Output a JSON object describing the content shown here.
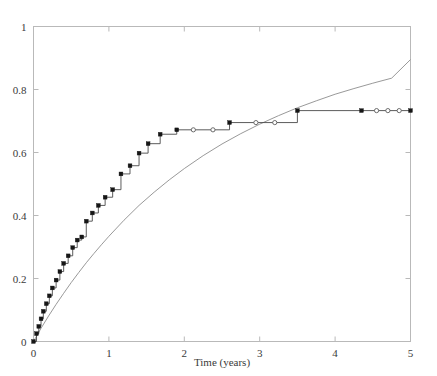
{
  "chart_data": {
    "type": "line",
    "title": "",
    "subtitle": "",
    "xlabel": "Time (years)",
    "ylabel": "",
    "xlim": [
      0,
      5
    ],
    "ylim": [
      0,
      1
    ],
    "grid": false,
    "legend": null,
    "xticks": [
      0,
      1,
      2,
      3,
      4,
      5
    ],
    "xticklabels": [
      "0",
      "1",
      "2",
      "3",
      "4",
      "5"
    ],
    "yticks": [
      0,
      0.2,
      0.4,
      0.6,
      0.8,
      1
    ],
    "yticklabels": [
      "0",
      "0.2",
      "0.4",
      "0.6",
      "0.8",
      "1"
    ],
    "series": [
      {
        "name": "step-estimate",
        "style": "step-post",
        "marker": "square-and-circle",
        "color": "#4a4a4a",
        "x": [
          0.0,
          0.04,
          0.07,
          0.1,
          0.13,
          0.17,
          0.21,
          0.25,
          0.3,
          0.35,
          0.4,
          0.46,
          0.52,
          0.58,
          0.64,
          0.7,
          0.78,
          0.86,
          0.95,
          1.05,
          1.16,
          1.28,
          1.4,
          1.52,
          1.68,
          1.9,
          2.12,
          2.38,
          2.6,
          2.95,
          3.2,
          3.5,
          4.35,
          4.55,
          4.7,
          4.85,
          5.0
        ],
        "y": [
          0.0,
          0.025,
          0.048,
          0.072,
          0.096,
          0.12,
          0.145,
          0.17,
          0.195,
          0.222,
          0.248,
          0.272,
          0.298,
          0.322,
          0.332,
          0.382,
          0.408,
          0.432,
          0.458,
          0.482,
          0.532,
          0.558,
          0.598,
          0.628,
          0.658,
          0.672,
          0.672,
          0.672,
          0.695,
          0.695,
          0.695,
          0.733,
          0.733,
          0.733,
          0.733,
          0.733,
          0.733
        ],
        "marker_types": [
          "event",
          "event",
          "event",
          "event",
          "event",
          "event",
          "event",
          "event",
          "event",
          "event",
          "event",
          "event",
          "event",
          "event",
          "event",
          "event",
          "event",
          "event",
          "event",
          "event",
          "event",
          "event",
          "event",
          "event",
          "event",
          "event",
          "censored",
          "censored",
          "event",
          "censored",
          "censored",
          "event",
          "event",
          "censored",
          "censored",
          "censored",
          "event"
        ]
      },
      {
        "name": "smooth-fit",
        "style": "smooth",
        "marker": "none",
        "color": "#8d8d8d",
        "x": [
          0.0,
          0.1,
          0.2,
          0.3,
          0.4,
          0.5,
          0.6,
          0.7,
          0.8,
          0.9,
          1.0,
          1.2,
          1.4,
          1.6,
          1.8,
          2.0,
          2.25,
          2.5,
          2.75,
          3.0,
          3.25,
          3.5,
          3.75,
          4.0,
          4.25,
          4.5,
          4.75,
          5.0
        ],
        "y": [
          0.0,
          0.042,
          0.081,
          0.118,
          0.153,
          0.187,
          0.219,
          0.25,
          0.279,
          0.307,
          0.334,
          0.385,
          0.432,
          0.474,
          0.513,
          0.549,
          0.59,
          0.627,
          0.66,
          0.69,
          0.717,
          0.742,
          0.764,
          0.785,
          0.803,
          0.82,
          0.836,
          0.895
        ]
      }
    ],
    "annotations": []
  },
  "figure": {
    "background_color": "#ffffff",
    "axis_color": "#b9b9b9",
    "text_color": "#3a3a3a"
  }
}
